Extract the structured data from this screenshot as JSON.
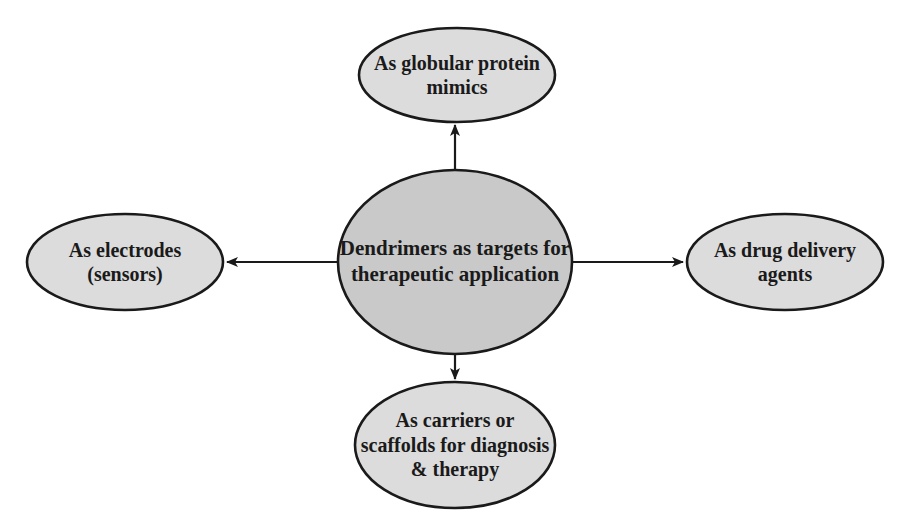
{
  "diagram": {
    "type": "hub-and-spoke",
    "colors": {
      "background": "#ffffff",
      "center_fill": "#c9c9c9",
      "outer_fill": "#dcdcdc",
      "stroke": "#1a1a1a",
      "text": "#1a1a1a"
    },
    "center": {
      "id": "center",
      "label": "Dendrimers as targets for\ntherapeutic application",
      "cx": 455,
      "cy": 262,
      "rx": 117,
      "ry": 92
    },
    "nodes": [
      {
        "id": "top",
        "label": "As globular protein\nmimics",
        "cx": 457,
        "cy": 75,
        "rx": 98,
        "ry": 47
      },
      {
        "id": "left",
        "label": "As electrodes\n(sensors)",
        "cx": 125,
        "cy": 262,
        "rx": 98,
        "ry": 48
      },
      {
        "id": "right",
        "label": "As drug delivery\nagents",
        "cx": 785,
        "cy": 262,
        "rx": 98,
        "ry": 48
      },
      {
        "id": "bottom",
        "label": "As carriers or\nscaffolds for diagnosis\n& therapy",
        "cx": 455,
        "cy": 445,
        "rx": 100,
        "ry": 63
      }
    ],
    "edges": [
      {
        "from": "center",
        "to": "top",
        "x1": 455,
        "y1": 170,
        "x2": 455,
        "y2": 125
      },
      {
        "from": "center",
        "to": "left",
        "x1": 338,
        "y1": 262,
        "x2": 227,
        "y2": 262
      },
      {
        "from": "center",
        "to": "right",
        "x1": 572,
        "y1": 262,
        "x2": 683,
        "y2": 262
      },
      {
        "from": "center",
        "to": "bottom",
        "x1": 455,
        "y1": 354,
        "x2": 455,
        "y2": 379
      }
    ]
  }
}
